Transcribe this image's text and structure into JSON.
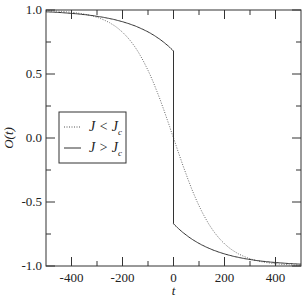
{
  "chart_data": {
    "type": "line",
    "title": "",
    "xlabel": "t",
    "ylabel": "O(t)",
    "xlim": [
      -500,
      500
    ],
    "ylim": [
      -1.0,
      1.0
    ],
    "xticks": [
      -400,
      -200,
      0,
      200,
      400
    ],
    "xtick_labels": [
      "-400",
      "-200",
      "0",
      "200",
      "400"
    ],
    "yticks": [
      1.0,
      0.5,
      0.0,
      -0.5,
      -1.0
    ],
    "ytick_labels": [
      "1.0",
      "0.5",
      "0.0",
      "-0.5",
      "-1.0"
    ],
    "grid": false,
    "legend_position": "center-left",
    "series": [
      {
        "name": "J < Jc",
        "style": "dotted",
        "x": [
          -500,
          -400,
          -300,
          -200,
          -150,
          -100,
          -50,
          0,
          50,
          100,
          150,
          200,
          300,
          400,
          500
        ],
        "y": [
          0.99,
          0.98,
          0.91,
          0.76,
          0.64,
          0.46,
          0.24,
          0.0,
          -0.24,
          -0.46,
          -0.64,
          -0.76,
          -0.91,
          -0.98,
          -0.99
        ]
      },
      {
        "name": "J > Jc",
        "style": "solid",
        "x": [
          -500,
          -400,
          -300,
          -200,
          -100,
          -50,
          -0.1,
          0.1,
          50,
          100,
          200,
          300,
          400,
          500
        ],
        "y": [
          1.0,
          0.995,
          0.98,
          0.93,
          0.84,
          0.77,
          0.68,
          -0.67,
          -0.77,
          -0.84,
          -0.93,
          -0.98,
          -0.995,
          -1.0
        ]
      }
    ],
    "legend": [
      {
        "label_main": "J < J",
        "label_sub": "c",
        "style": "dotted"
      },
      {
        "label_main": "J > J",
        "label_sub": "c",
        "style": "solid"
      }
    ]
  }
}
